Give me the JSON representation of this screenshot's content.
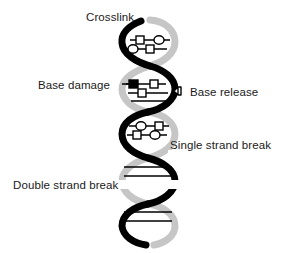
{
  "diagram": {
    "background_color": "#ffffff"
  },
  "labels": {
    "crosslink": "Crosslink",
    "base_damage": "Base damage",
    "base_release": "Base release",
    "single_strand_break": "Single strand break",
    "double_strand_break": "Double strand break"
  },
  "colors": {
    "strand_front": "#000000",
    "strand_back": "#c6c6c6",
    "rung": "#000000",
    "text": "#1a1a1a",
    "lesion_fill_open": "#ffffff",
    "lesion_fill_solid": "#000000"
  },
  "icons": {
    "crosslink_marker": "linked-base-pair-icon",
    "base_damage_marker": "filled-square-base-icon",
    "base_release_marker": "detached-base-icon",
    "single_strand_break_marker": "broken-rung-icon",
    "double_strand_break_marker": "severed-helix-icon"
  },
  "helix": {
    "turns": 5,
    "x_center": 147,
    "x_amplitude": 27,
    "y_top": 18,
    "y_bottom": 248,
    "period": 46,
    "strand_width": 6
  },
  "lesions": [
    {
      "name": "crosslink",
      "region_y": 38,
      "shapes": [
        "circle",
        "square",
        "square",
        "circle"
      ]
    },
    {
      "name": "base-damage",
      "region_y": 84,
      "shapes": [
        "filled-square",
        "square",
        "square"
      ]
    },
    {
      "name": "base-release",
      "region_y": 91,
      "shapes": [
        "detached-base"
      ]
    },
    {
      "name": "single-strand-break",
      "region_y": 128,
      "shapes": [
        "circle",
        "square",
        "square",
        "circle"
      ]
    },
    {
      "name": "double-strand-break",
      "region_y": 185,
      "shapes": [
        "cut"
      ]
    }
  ]
}
